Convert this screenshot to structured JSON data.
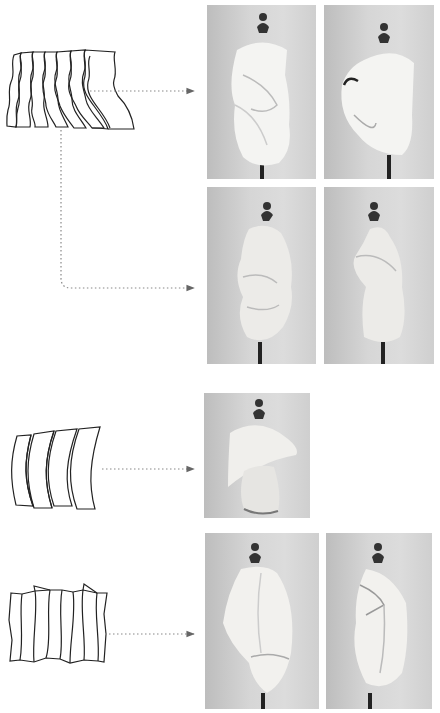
{
  "figure": {
    "colors": {
      "background": "#ffffff",
      "line": "#222222",
      "arrow": "#888888",
      "photo_bg": "#d4d4d4",
      "fabric": "#f2f2f0",
      "stand": "#222222"
    },
    "groups": [
      {
        "id": "group-1",
        "pattern": "wavy-strips-fan",
        "pattern_pieces": 7,
        "arrows": 2,
        "photos": [
          {
            "id": "photo-1a",
            "view": "front"
          },
          {
            "id": "photo-1b",
            "view": "three-quarter"
          },
          {
            "id": "photo-1c",
            "view": "side-left"
          },
          {
            "id": "photo-1d",
            "view": "side-right"
          }
        ]
      },
      {
        "id": "group-2",
        "pattern": "curved-panels",
        "pattern_pieces": 4,
        "arrows": 1,
        "photos": [
          {
            "id": "photo-2a",
            "view": "front"
          }
        ]
      },
      {
        "id": "group-3",
        "pattern": "zigzag-pleated-panels",
        "pattern_pieces": 8,
        "arrows": 1,
        "photos": [
          {
            "id": "photo-3a",
            "view": "front"
          },
          {
            "id": "photo-3b",
            "view": "side"
          }
        ]
      }
    ]
  }
}
